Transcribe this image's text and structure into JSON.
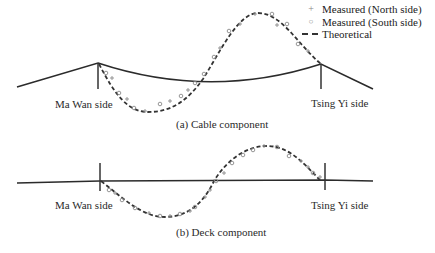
{
  "legend": {
    "items": [
      {
        "symbol": "plus-marker",
        "label": "Measured (North side)"
      },
      {
        "symbol": "circle-marker",
        "label": "Measured (South side)"
      },
      {
        "symbol": "dashed-line",
        "label": "Theoretical"
      }
    ]
  },
  "panels": [
    {
      "id": "cable",
      "caption": "(a) Cable component",
      "left_label": "Ma Wan side",
      "right_label": "Tsing Yi side"
    },
    {
      "id": "deck",
      "caption": "(b) Deck component",
      "left_label": "Ma Wan side",
      "right_label": "Tsing Yi side"
    }
  ],
  "colors": {
    "structure_line": "#2b2b2b",
    "theoretical": "#333333",
    "measured_marker": "#8a8a8a"
  }
}
